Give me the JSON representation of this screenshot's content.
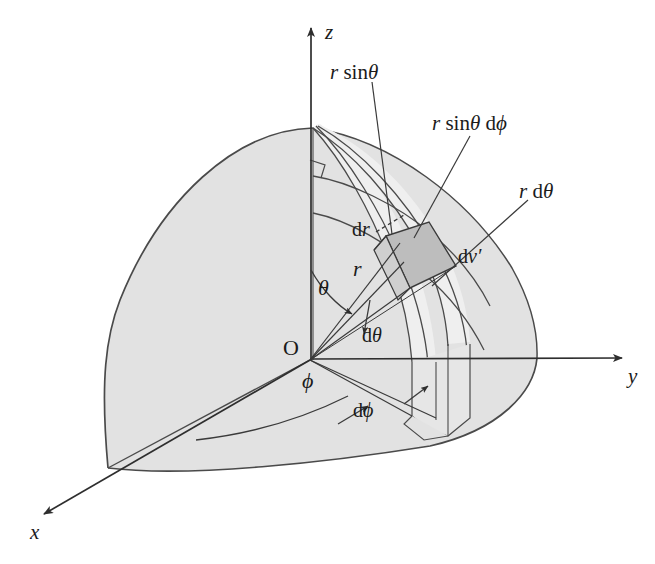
{
  "figure": {
    "background_color": "#ffffff",
    "ink_color": "#3a3a3a",
    "sphere_fill": "#e0e0e0",
    "band_fill": "#ebebeb",
    "element_fill": "#b9b9b9",
    "axes": [
      {
        "name": "z-axis",
        "label": "z",
        "direction": "up"
      },
      {
        "name": "y-axis",
        "label": "y",
        "direction": "right"
      },
      {
        "name": "x-axis",
        "label": "x",
        "direction": "lower-left"
      }
    ],
    "origin_label": "O",
    "annotations": [
      {
        "name": "r-sin-theta",
        "label_html": "<span class=\"it\">r</span> <span class=\"up\">sin</span><span class=\"it\">θ</span>",
        "x": 330,
        "y": 62
      },
      {
        "name": "r-sin-theta-d-phi",
        "label_html": "<span class=\"it\">r</span> <span class=\"up\">sin</span><span class=\"it\">θ</span> <span class=\"up\">d</span><span class=\"it\">ϕ</span>",
        "x": 432,
        "y": 113
      },
      {
        "name": "r-d-theta",
        "label_html": "<span class=\"it\">r</span> <span class=\"up\">d</span><span class=\"it\">θ</span>",
        "x": 520,
        "y": 181
      },
      {
        "name": "d-r",
        "label_html": "<span class=\"up\">d</span><span class=\"it\">r</span>",
        "x": 355,
        "y": 220
      },
      {
        "name": "d-v-prime",
        "label_html": "<span class=\"up\">d</span><span class=\"it\">v′</span>",
        "x": 460,
        "y": 245
      },
      {
        "name": "r-radius",
        "label_html": "<span class=\"it\">r</span>",
        "x": 355,
        "y": 264
      },
      {
        "name": "theta-angle",
        "label_html": "<span class=\"it\">θ</span>",
        "x": 320,
        "y": 278
      },
      {
        "name": "d-theta",
        "label_html": "<span class=\"up\">d</span><span class=\"it\">θ</span>",
        "x": 363,
        "y": 326
      },
      {
        "name": "phi-angle",
        "label_html": "<span class=\"it\">ϕ</span>",
        "x": 303,
        "y": 372
      },
      {
        "name": "d-phi",
        "label_html": "<span class=\"up\">d</span><span class=\"it\">ϕ</span>",
        "x": 355,
        "y": 400
      }
    ],
    "labels": {
      "z": "z",
      "y": "y",
      "x": "x",
      "origin": "O",
      "r_sin_theta": "r sinθ",
      "r_sin_theta_d_phi": "r sinθ dϕ",
      "r_d_theta": "r dθ",
      "d_r": "d r",
      "d_v_prime": "d v′",
      "r": "r",
      "theta": "θ",
      "d_theta": "dθ",
      "phi": "ϕ",
      "d_phi": "dϕ"
    },
    "geometry": {
      "origin": {
        "x": 310,
        "y": 360
      },
      "pole": {
        "x": 313,
        "y": 128
      },
      "y_axis_end": {
        "x": 628,
        "y": 358
      },
      "z_axis_end": {
        "x": 311,
        "y": 22
      },
      "x_axis_end": {
        "x": 38,
        "y": 518
      },
      "sphere_radius_px": 227
    }
  }
}
